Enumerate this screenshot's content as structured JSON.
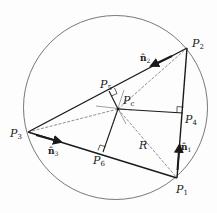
{
  "diagram": {
    "title": "",
    "colors": {
      "line": "#1a1a1a",
      "circle": "#555555",
      "dashed": "#444444",
      "background": "#fdfdfd"
    },
    "circumcircle": {
      "cx": 115.5,
      "cy": 107.5,
      "r": 92
    },
    "points": {
      "P1": {
        "label": "P",
        "sub": "1",
        "x": 177,
        "y": 178
      },
      "P2": {
        "label": "P",
        "sub": "2",
        "x": 187,
        "y": 48
      },
      "P3": {
        "label": "P",
        "sub": "3",
        "x": 28,
        "y": 132
      },
      "P4": {
        "label": "P",
        "sub": "4",
        "x": 183,
        "y": 113
      },
      "P5": {
        "label": "P",
        "sub": "5",
        "x": 109,
        "y": 91
      },
      "P6": {
        "label": "P",
        "sub": "6",
        "x": 103,
        "y": 152
      },
      "Pc": {
        "label": "P",
        "sub": "c",
        "x": 118,
        "y": 109
      }
    },
    "vectors": {
      "n1": {
        "label": "n̂",
        "sub": "1"
      },
      "n2": {
        "label": "n̂",
        "sub": "2"
      },
      "n3": {
        "label": "n̂",
        "sub": "3"
      }
    },
    "radius_label": "R"
  }
}
